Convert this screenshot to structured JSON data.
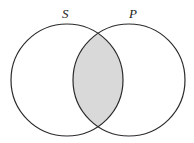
{
  "diagram": {
    "type": "venn",
    "sets": [
      {
        "id": "S",
        "label": "S",
        "cx": 67,
        "cy": 80,
        "r": 56
      },
      {
        "id": "P",
        "label": "P",
        "cx": 129,
        "cy": 80,
        "r": 56
      }
    ],
    "shaded_regions": [
      "S∩P"
    ],
    "colors": {
      "stroke": "#2a2a2a",
      "shade": "#d9d9d9",
      "background": "#ffffff"
    }
  }
}
